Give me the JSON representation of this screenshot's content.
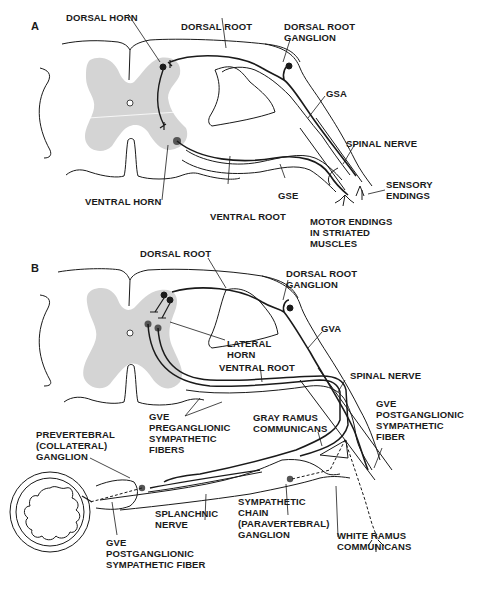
{
  "figure": {
    "panels": [
      {
        "id": "A",
        "letter": "A",
        "labels": {
          "dorsal_horn": "DORSAL HORN",
          "dorsal_root": "DORSAL ROOT",
          "dorsal_root_ganglion": "DORSAL ROOT\nGANGLION",
          "gsa": "GSA",
          "spinal_nerve": "SPINAL NERVE",
          "sensory_endings": "SENSORY\nENDINGS",
          "gse": "GSE",
          "ventral_horn": "VENTRAL HORN",
          "ventral_root": "VENTRAL ROOT",
          "motor_endings": "MOTOR ENDINGS\nIN STRIATED\nMUSCLES"
        }
      },
      {
        "id": "B",
        "letter": "B",
        "labels": {
          "dorsal_root": "DORSAL ROOT",
          "dorsal_root_ganglion": "DORSAL ROOT\nGANGLION",
          "gva": "GVA",
          "lateral_horn": "LATERAL\nHORN",
          "ventral_root": "VENTRAL ROOT",
          "spinal_nerve": "SPINAL NERVE",
          "gve_preganglionic": "GVE\nPREGANGLIONIC\nSYMPATHETIC\nFIBERS",
          "gray_ramus": "GRAY RAMUS\nCOMMUNICANS",
          "gve_postganglionic_right": "GVE\nPOSTGANGLIONIC\nSYMPATHETIC\nFIBER",
          "prevertebral_ganglion": "PREVERTEBRAL\n(COLLATERAL)\nGANGLION",
          "splanchnic_nerve": "SPLANCHNIC\nNERVE",
          "sympathetic_chain": "SYMPATHETIC\nCHAIN\n(PARAVERTEBRAL)\nGANGLION",
          "white_ramus": "WHITE RAMUS\nCOMMUNICANS",
          "gve_postganglionic_left": "GVE\nPOSTGANGLIONIC\nSYMPATHETIC FIBER"
        }
      }
    ],
    "colors": {
      "gray_matter": "#d4d4d4",
      "line": "#1a1a1a",
      "background": "#ffffff"
    }
  }
}
